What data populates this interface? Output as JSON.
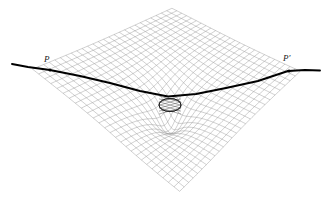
{
  "figure": {
    "kind": "spacetime-curvature-diagram",
    "caption": "",
    "background_color": "#ffffff",
    "width": 331,
    "height": 201
  },
  "labels": {
    "left_point": "P",
    "right_point": "P′"
  },
  "colors": {
    "grid_line": "#8a8a8a",
    "grid_line_faint": "#b9b9b9",
    "geodesic": "#000000",
    "mass_outline": "#1c1c1c",
    "marker": "#000000",
    "background": "#ffffff"
  },
  "chart_data": {
    "type": "line",
    "title": "",
    "subtitle": "",
    "xlabel": "",
    "ylabel": "",
    "grid": true,
    "legend": null,
    "plane": {
      "shape": "rhombus",
      "description": "deformed grid sheet rendered in perspective",
      "vertices": {
        "left": [
          28,
          68
        ],
        "top": [
          172,
          7
        ],
        "right": [
          305,
          70
        ],
        "bottom": [
          180,
          190
        ]
      },
      "grid_divisions_u": 26,
      "grid_divisions_v": 26
    },
    "well": {
      "center": [
        170,
        100
      ],
      "radius_x": 92,
      "radius_y": 62,
      "depth": 30,
      "description": "gravitational potential well depressing the grid"
    },
    "series": [
      {
        "name": "geodesic",
        "description": "light ray path bent by the mass, from P to P-prime",
        "x": [
          12,
          28,
          50,
          80,
          110,
          140,
          168,
          196,
          226,
          258,
          288,
          305,
          320
        ],
        "y": [
          64,
          67,
          70,
          76,
          83,
          91,
          96.5,
          94,
          88,
          81,
          71,
          70,
          70.5
        ],
        "stroke_width": 1.9
      }
    ],
    "annotations": [
      {
        "label": "P",
        "point": [
          50,
          70
        ],
        "label_pos": [
          48,
          62
        ]
      },
      {
        "label": "P′",
        "point": [
          289,
          71
        ],
        "label_pos": [
          288,
          61
        ]
      }
    ],
    "markers": [
      {
        "name": "source-point-p",
        "x": 50,
        "y": 70
      },
      {
        "name": "observer-point-pprime",
        "x": 289,
        "y": 71
      }
    ],
    "mass": {
      "name": "central-mass",
      "shape": "wireframe-ellipsoid",
      "center": [
        170,
        105
      ],
      "width": 22,
      "height": 13
    }
  }
}
